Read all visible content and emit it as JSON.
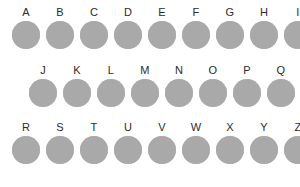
{
  "figure": {
    "background_color": "#ffffff",
    "disc_color": "#a9a9a9",
    "label_color": "#2b2b2b",
    "disc_diameter_px": 28,
    "column_pitch_px": 34,
    "rows": [
      {
        "name": "row-1",
        "left_px": 12,
        "top_px": 6,
        "labels": [
          "A",
          "B",
          "C",
          "D",
          "E",
          "F",
          "G",
          "H",
          "I"
        ]
      },
      {
        "name": "row-2",
        "left_px": 29,
        "top_px": 64,
        "labels": [
          "J",
          "K",
          "L",
          "M",
          "N",
          "O",
          "P",
          "Q"
        ]
      },
      {
        "name": "row-3",
        "left_px": 12,
        "top_px": 121,
        "labels": [
          "R",
          "S",
          "T",
          "U",
          "V",
          "W",
          "X",
          "Y",
          "Z"
        ]
      }
    ]
  }
}
